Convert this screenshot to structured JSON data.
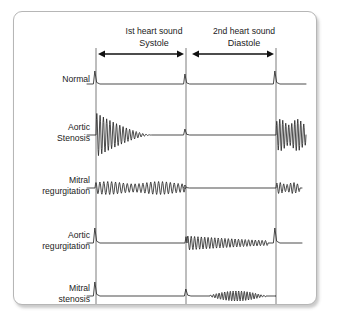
{
  "figure": {
    "title_columns": [
      {
        "label": "Ist heart sound",
        "x": 140
      },
      {
        "label": "2nd heart sound",
        "x": 230
      }
    ],
    "phases": [
      {
        "label": "Systole",
        "x_center": 140,
        "x_start": 82,
        "x_end": 172
      },
      {
        "label": "Diastole",
        "x_center": 230,
        "x_start": 176,
        "x_end": 262
      }
    ],
    "timing_lines": [
      {
        "name": "s1-line",
        "x": 82
      },
      {
        "name": "s2-line",
        "x": 172
      },
      {
        "name": "s1-next-line",
        "x": 262
      }
    ],
    "geometry": {
      "svg_width": 302,
      "svg_height": 292,
      "trace_end_x": 292,
      "label_x": 76,
      "header_y": 22,
      "phase_y": 34,
      "arrow_y": 42
    },
    "rows": [
      {
        "name": "normal",
        "label_lines": [
          "Normal"
        ],
        "baseline_y": 72,
        "label_y": 70,
        "murmur": {
          "systole": "none",
          "diastole": "none"
        },
        "s1_amplitude": 13,
        "s2_amplitude": 10,
        "description": "Sharp S1 and S2 spikes with flat baseline, no murmur"
      },
      {
        "name": "aortic-stenosis",
        "label_lines": [
          "Aortic",
          "Stenosis"
        ],
        "baseline_y": 123,
        "label_y": 118,
        "murmur": {
          "systole": "decrescendo",
          "diastole": "none"
        },
        "systole_amplitude": 22,
        "systole_cycles": 17,
        "s1_amplitude": 4,
        "s2_amplitude": 6,
        "description": "Loud diamond/decrescendo systolic ejection murmur after S1"
      },
      {
        "name": "mitral-regurgitation",
        "label_lines": [
          "Mitral",
          "regurgitation"
        ],
        "baseline_y": 176,
        "label_y": 171,
        "murmur": {
          "systole": "uniform",
          "diastole": "none"
        },
        "systole_amplitude": 6.5,
        "systole_cycles": 23,
        "s1_amplitude": 8,
        "s2_amplitude": 3,
        "description": "Pansystolic uniform murmur filling all of systole"
      },
      {
        "name": "aortic-regurgitation",
        "label_lines": [
          "Aortic",
          "regurgitation"
        ],
        "baseline_y": 231,
        "label_y": 226,
        "murmur": {
          "systole": "none",
          "diastole": "decrescendo-early"
        },
        "diastole_amplitude": 7,
        "diastole_cycles": 24,
        "s1_amplitude": 15,
        "s2_amplitude": 11,
        "description": "Early diastolic decrescendo murmur beginning right after S2"
      },
      {
        "name": "mitral-stenosis",
        "label_lines": [
          "Mitral",
          "stenosis"
        ],
        "baseline_y": 284,
        "label_y": 279,
        "murmur": {
          "systole": "none",
          "diastole": "mid-rumble"
        },
        "diastole_amplitude": 5,
        "diastole_cycles": 20,
        "s1_amplitude": 14,
        "s2_amplitude": 7,
        "description": "Opening snap after S2 then mid-diastolic rumble with presystolic accentuation"
      }
    ]
  },
  "colors": {
    "trace": "#2a2a2a",
    "timing_line": "#6e6e6e",
    "border": "#b6b6b6",
    "text": "#1b1b1b",
    "background": "#ffffff"
  }
}
